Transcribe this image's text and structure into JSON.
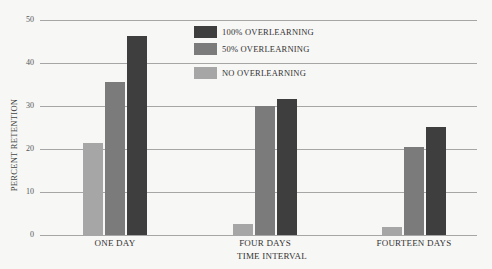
{
  "chart_data": {
    "type": "bar",
    "title": "",
    "xlabel": "TIME INTERVAL",
    "ylabel": "PERCENT RETENTION",
    "ylim": [
      0,
      50
    ],
    "yticks": [
      0,
      10,
      20,
      30,
      40,
      50
    ],
    "grid": true,
    "legend_position": "top-center",
    "categories": [
      "ONE DAY",
      "FOUR DAYS",
      "FOURTEEN DAYS"
    ],
    "series": [
      {
        "name": "NO OVERLEARNING",
        "color": "#a6a6a6",
        "values": [
          21.5,
          2.5,
          1.8
        ]
      },
      {
        "name": "50% OVERLEARNING",
        "color": "#7b7b7b",
        "values": [
          35.5,
          30.0,
          20.5
        ]
      },
      {
        "name": "100% OVERLEARNING",
        "color": "#3e3e3e",
        "values": [
          46.3,
          31.6,
          25.2
        ]
      }
    ]
  },
  "legend": [
    {
      "label": "100% OVERLEARNING",
      "color": "#3e3e3e"
    },
    {
      "label": "50% OVERLEARNING",
      "color": "#7b7b7b"
    },
    {
      "label": "NO OVERLEARNING",
      "color": "#a6a6a6"
    }
  ]
}
